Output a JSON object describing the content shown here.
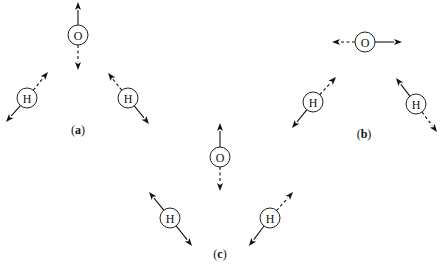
{
  "figure": {
    "atom_radius": 10,
    "arrowhead": {
      "length": 8,
      "width": 6
    },
    "panels": [
      {
        "id": "a",
        "label": "a",
        "label_pos": [
          78,
          134
        ],
        "atoms": [
          {
            "element": "O",
            "cx": 78,
            "cy": 35,
            "arrows": [
              {
                "to": [
                  78,
                  2
                ],
                "style": "solid"
              },
              {
                "to": [
                  78,
                  70
                ],
                "style": "dashed"
              }
            ]
          },
          {
            "element": "H",
            "cx": 27,
            "cy": 98,
            "arrows": [
              {
                "to": [
                  48,
                  72
                ],
                "style": "dashed"
              },
              {
                "to": [
                  6,
                  122
                ],
                "style": "solid"
              }
            ]
          },
          {
            "element": "H",
            "cx": 128,
            "cy": 98,
            "arrows": [
              {
                "to": [
                  108,
                  73
                ],
                "style": "dashed"
              },
              {
                "to": [
                  149,
                  124
                ],
                "style": "solid"
              }
            ]
          }
        ]
      },
      {
        "id": "b",
        "label": "b",
        "label_pos": [
          364,
          138
        ],
        "atoms": [
          {
            "element": "O",
            "cx": 365,
            "cy": 42,
            "arrows": [
              {
                "to": [
                  332,
                  42
                ],
                "style": "dashed"
              },
              {
                "to": [
                  402,
                  42
                ],
                "style": "solid"
              }
            ]
          },
          {
            "element": "H",
            "cx": 313,
            "cy": 102,
            "arrows": [
              {
                "to": [
                  336,
                  77
                ],
                "style": "dashed"
              },
              {
                "to": [
                  292,
                  128
                ],
                "style": "solid"
              }
            ]
          },
          {
            "element": "H",
            "cx": 416,
            "cy": 104,
            "arrows": [
              {
                "to": [
                  396,
                  78
                ],
                "style": "solid"
              },
              {
                "to": [
                  437,
                  132
                ],
                "style": "dashed"
              }
            ]
          }
        ]
      },
      {
        "id": "c",
        "label": "c",
        "label_pos": [
          220,
          258
        ],
        "atoms": [
          {
            "element": "O",
            "cx": 220,
            "cy": 157,
            "arrows": [
              {
                "to": [
                  220,
                  123
                ],
                "style": "solid"
              },
              {
                "to": [
                  220,
                  191
                ],
                "style": "dashed"
              }
            ]
          },
          {
            "element": "H",
            "cx": 170,
            "cy": 218,
            "arrows": [
              {
                "to": [
                  149,
                  192
                ],
                "style": "solid"
              },
              {
                "to": [
                  192,
                  246
                ],
                "style": "solid"
              }
            ]
          },
          {
            "element": "H",
            "cx": 270,
            "cy": 218,
            "arrows": [
              {
                "to": [
                  293,
                  192
                ],
                "style": "dashed"
              },
              {
                "to": [
                  249,
                  246
                ],
                "style": "solid"
              }
            ]
          }
        ]
      }
    ]
  }
}
